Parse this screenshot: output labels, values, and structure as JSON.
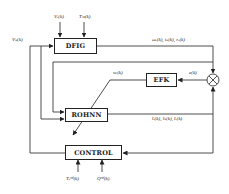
{
  "diagram": {
    "blocks": {
      "dfig": "DFIG",
      "efk": "EFK",
      "rohnn": "ROHNN",
      "control": "CONTROL"
    },
    "signals": {
      "vr": "Vᵣ(k)",
      "tm": "Tₘ(k)",
      "vs": "Vₛ(k)",
      "dfig_out": "ωᵣ(k), iₛ(k), rᵣ(k)",
      "error": "e(k)",
      "weights": "wᵢ(k)",
      "rohnn_out": "îᵣ(k), îₛ(k), îᵣ(k)",
      "tref": "Tₑʳᵉᶠ(k)",
      "qref": "Qʳᵉᶠ(k)"
    },
    "summing_junction": "⊗"
  }
}
